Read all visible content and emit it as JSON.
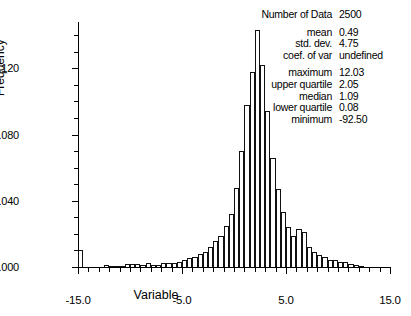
{
  "chart_data": {
    "type": "bar",
    "title": "",
    "xlabel": "Variable",
    "ylabel": "Frequency",
    "xlim": [
      -15.0,
      15.0
    ],
    "ylim": [
      0.0,
      0.148
    ],
    "grid": false,
    "bin_width": 0.5,
    "xticks": [
      {
        "value": -15.0,
        "label": "-15.0"
      },
      {
        "value": -5.0,
        "label": "-5.0"
      },
      {
        "value": 5.0,
        "label": "5.0"
      },
      {
        "value": 15.0,
        "label": "15.0"
      }
    ],
    "yticks": [
      {
        "value": 0.0,
        "label": ".000"
      },
      {
        "value": 0.04,
        "label": ".040"
      },
      {
        "value": 0.08,
        "label": ".080"
      },
      {
        "value": 0.12,
        "label": ".120"
      }
    ],
    "x": [
      -15.0,
      -14.5,
      -14.0,
      -13.5,
      -13.0,
      -12.5,
      -12.0,
      -11.5,
      -11.0,
      -10.5,
      -10.0,
      -9.5,
      -9.0,
      -8.5,
      -8.0,
      -7.5,
      -7.0,
      -6.5,
      -6.0,
      -5.5,
      -5.0,
      -4.5,
      -4.0,
      -3.5,
      -3.0,
      -2.5,
      -2.0,
      -1.5,
      -1.0,
      -0.5,
      0.0,
      0.5,
      1.0,
      1.5,
      2.0,
      2.5,
      3.0,
      3.5,
      4.0,
      4.5,
      5.0,
      5.5,
      6.0,
      6.5,
      7.0,
      7.5,
      8.0,
      8.5,
      9.0,
      9.5,
      10.0,
      10.5,
      11.0,
      11.5,
      12.0
    ],
    "values": [
      0.0105,
      0.0,
      0.0,
      0.0,
      0.0,
      0.001,
      0.0008,
      0.0004,
      0.0006,
      0.0016,
      0.0018,
      0.002,
      0.0014,
      0.0022,
      0.001,
      0.0012,
      0.0022,
      0.0026,
      0.0024,
      0.003,
      0.0044,
      0.0056,
      0.0062,
      0.0078,
      0.009,
      0.012,
      0.016,
      0.019,
      0.025,
      0.032,
      0.048,
      0.07,
      0.098,
      0.118,
      0.143,
      0.122,
      0.094,
      0.066,
      0.047,
      0.033,
      0.024,
      0.019,
      0.023,
      0.021,
      0.012,
      0.009,
      0.007,
      0.0062,
      0.0044,
      0.004,
      0.003,
      0.0028,
      0.0016,
      0.0012,
      0.0008
    ]
  },
  "stats": {
    "rows_group_1": [
      {
        "label": "Number of Data",
        "value": "2500"
      }
    ],
    "rows_group_2": [
      {
        "label": "mean",
        "value": "0.49"
      },
      {
        "label": "std. dev.",
        "value": "4.75"
      },
      {
        "label": "coef. of var",
        "value": "undefined"
      }
    ],
    "rows_group_3": [
      {
        "label": "maximum",
        "value": "12.03"
      },
      {
        "label": "upper quartile",
        "value": "2.05"
      },
      {
        "label": "median",
        "value": "1.09"
      },
      {
        "label": "lower quartile",
        "value": "0.08"
      },
      {
        "label": "minimum",
        "value": "-92.50"
      }
    ]
  }
}
